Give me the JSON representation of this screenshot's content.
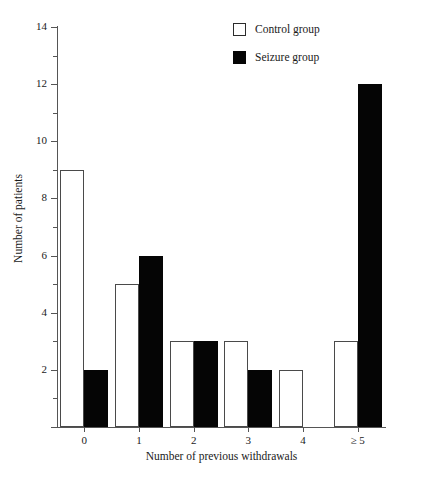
{
  "chart_data": {
    "type": "bar",
    "title": "",
    "subtitle": "",
    "xlabel": "Number of previous withdrawals",
    "ylabel": "Number of patients",
    "categories": [
      "0",
      "1",
      "2",
      "3",
      "4",
      "≥ 5"
    ],
    "series": [
      {
        "name": "Control group",
        "values": [
          9,
          5,
          3,
          3,
          2,
          3
        ],
        "color": "#ffffff",
        "edge_color": "#4a4a4a",
        "style": "open"
      },
      {
        "name": "Seizure group",
        "values": [
          2,
          6,
          3,
          2,
          0,
          12
        ],
        "color": "#050505",
        "edge_color": "#050505",
        "style": "filled"
      }
    ],
    "ylim": [
      0,
      14
    ],
    "y_major_ticks": [
      0,
      2,
      4,
      6,
      8,
      10,
      12,
      14
    ],
    "y_major_tick_labels": [
      "",
      "2",
      "4",
      "6",
      "8",
      "10",
      "12",
      "14"
    ],
    "y_minor_ticks": [
      1,
      3,
      5,
      7,
      9,
      11,
      13
    ],
    "grid": false,
    "legend_position": "top-right"
  },
  "axes": {
    "y_title": "Number of patients",
    "x_title": "Number of previous withdrawals"
  },
  "legend": {
    "entries": [
      {
        "label": "Control group"
      },
      {
        "label": "Seizure group"
      }
    ]
  }
}
